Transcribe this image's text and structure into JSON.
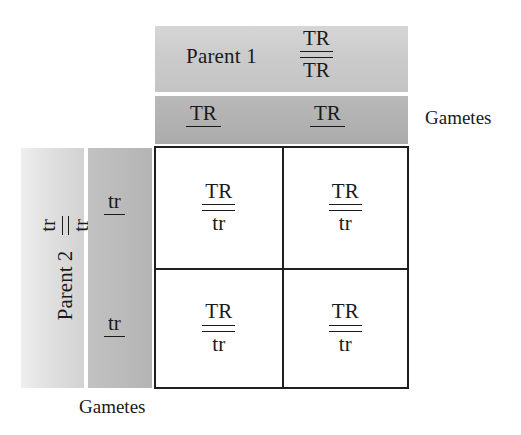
{
  "diagram": {
    "type": "punnett-square",
    "colors": {
      "ink": "#1a1a1a",
      "grid_border": "#1f1f1f",
      "parent1_band": "#cccccc",
      "parent1_gametes_band": "#b2b2b2",
      "parent2_band": "#e0e0e0",
      "parent2_gametes_band": "#bbbbbb",
      "cell_background": "#ffffff"
    }
  },
  "parent1": {
    "label": "Parent 1",
    "genotype": {
      "top": "TR",
      "bottom": "TR"
    },
    "gametes": [
      {
        "allele": "TR"
      },
      {
        "allele": "TR"
      }
    ]
  },
  "parent2": {
    "label": "Parent 2",
    "genotype": {
      "top": "tr",
      "bottom": "tr"
    },
    "gametes": [
      {
        "allele": "tr"
      },
      {
        "allele": "tr"
      }
    ]
  },
  "labels": {
    "gametes_right": "Gametes",
    "gametes_bottom": "Gametes"
  },
  "offspring": {
    "columns": [
      "TR",
      "TR"
    ],
    "rows": [
      "tr",
      "tr"
    ],
    "cells": [
      {
        "position": "top-left",
        "top": "TR",
        "bottom": "tr"
      },
      {
        "position": "top-right",
        "top": "TR",
        "bottom": "tr"
      },
      {
        "position": "bottom-left",
        "top": "TR",
        "bottom": "tr"
      },
      {
        "position": "bottom-right",
        "top": "TR",
        "bottom": "tr"
      }
    ]
  }
}
